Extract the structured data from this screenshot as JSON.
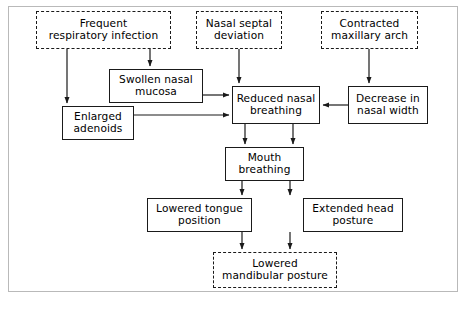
{
  "diagram": {
    "frame_color": "#b9b9b9",
    "line_color": "#1a1a1a",
    "background": "#ffffff",
    "nodes": [
      {
        "id": "frequent-respiratory-infection",
        "label": "Frequent\nrespiratory infection",
        "style": "dashed",
        "x": 36,
        "y": 11,
        "w": 135,
        "h": 38
      },
      {
        "id": "nasal-septal-deviation",
        "label": "Nasal septal\ndeviation",
        "style": "dashed",
        "x": 196,
        "y": 11,
        "w": 86,
        "h": 38
      },
      {
        "id": "contracted-maxillary-arch",
        "label": "Contracted\nmaxillary arch",
        "style": "dashed",
        "x": 321,
        "y": 11,
        "w": 97,
        "h": 38
      },
      {
        "id": "swollen-nasal-mucosa",
        "label": "Swollen nasal\nmucosa",
        "style": "solid",
        "x": 109,
        "y": 69,
        "w": 94,
        "h": 34
      },
      {
        "id": "reduced-nasal-breathing",
        "label": "Reduced nasal\nbreathing",
        "style": "solid",
        "x": 232,
        "y": 86,
        "w": 88,
        "h": 38
      },
      {
        "id": "decrease-in-nasal-width",
        "label": "Decrease in\nnasal width",
        "style": "solid",
        "x": 348,
        "y": 86,
        "w": 80,
        "h": 38
      },
      {
        "id": "enlarged-adenoids",
        "label": "Enlarged\nadenoids",
        "style": "solid",
        "x": 62,
        "y": 106,
        "w": 72,
        "h": 34
      },
      {
        "id": "mouth-breathing",
        "label": "Mouth\nbreathing",
        "style": "solid",
        "x": 225,
        "y": 147,
        "w": 79,
        "h": 34
      },
      {
        "id": "lowered-tongue-position",
        "label": "Lowered tongue\nposition",
        "style": "solid",
        "x": 147,
        "y": 198,
        "w": 105,
        "h": 34
      },
      {
        "id": "extended-head-posture",
        "label": "Extended head\nposture",
        "style": "solid",
        "x": 303,
        "y": 198,
        "w": 100,
        "h": 34
      },
      {
        "id": "lowered-mandibular-posture",
        "label": "Lowered\nmandibular posture",
        "style": "dashed",
        "x": 213,
        "y": 252,
        "w": 124,
        "h": 36
      }
    ],
    "edges": [
      {
        "id": "edge-infection-to-adenoids",
        "from": "frequent-respiratory-infection",
        "to": "enlarged-adenoids",
        "points": "67,49 67,103"
      },
      {
        "id": "edge-infection-to-mucosa",
        "from": "frequent-respiratory-infection",
        "to": "swollen-nasal-mucosa",
        "points": "150,49 150,66"
      },
      {
        "id": "edge-septal-to-reduced",
        "from": "nasal-septal-deviation",
        "to": "reduced-nasal-breathing",
        "points": "239,49 239,83"
      },
      {
        "id": "edge-maxillary-to-decrease",
        "from": "contracted-maxillary-arch",
        "to": "decrease-in-nasal-width",
        "points": "369,49 369,83"
      },
      {
        "id": "edge-mucosa-to-reduced",
        "from": "swollen-nasal-mucosa",
        "to": "reduced-nasal-breathing",
        "points": "203,95 229,95"
      },
      {
        "id": "edge-adenoids-to-reduced",
        "from": "enlarged-adenoids",
        "to": "reduced-nasal-breathing",
        "points": "134,115 229,115"
      },
      {
        "id": "edge-decrease-to-reduced",
        "from": "decrease-in-nasal-width",
        "to": "reduced-nasal-breathing",
        "points": "348,105 323,105"
      },
      {
        "id": "edge-reduced-to-mouth-left",
        "from": "reduced-nasal-breathing",
        "to": "mouth-breathing",
        "points": "245,124 245,144"
      },
      {
        "id": "edge-reduced-to-mouth-right",
        "from": "reduced-nasal-breathing",
        "to": "mouth-breathing",
        "points": "293,124 293,144"
      },
      {
        "id": "edge-mouth-to-tongue",
        "from": "mouth-breathing",
        "to": "lowered-tongue-position",
        "points": "242,181 242,195"
      },
      {
        "id": "edge-mouth-to-head",
        "from": "mouth-breathing",
        "to": "extended-head-posture",
        "points": "290,181 290,195"
      },
      {
        "id": "edge-tongue-to-mandibular",
        "from": "lowered-tongue-position",
        "to": "lowered-mandibular-posture",
        "points": "242,232 242,249"
      },
      {
        "id": "edge-head-to-mandibular",
        "from": "extended-head-posture",
        "to": "lowered-mandibular-posture",
        "points": "290,232 290,249"
      }
    ]
  }
}
